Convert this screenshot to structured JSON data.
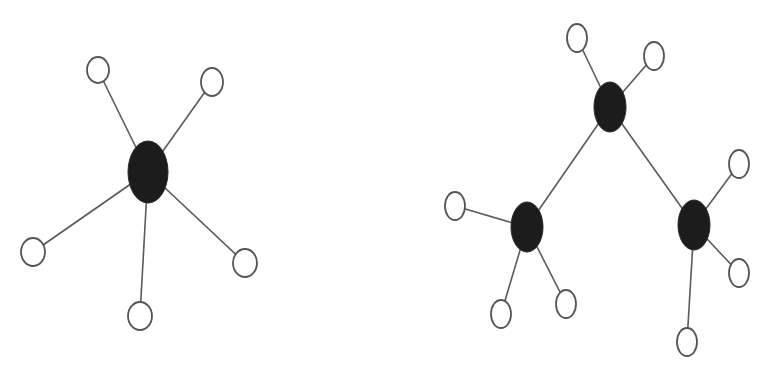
{
  "diagram": {
    "description": "Two network topology graphs: a star topology (left) and a tree/hierarchical topology (right)",
    "colors": {
      "hub": "#1c1c1c",
      "leaf_fill": "#ffffff",
      "leaf_stroke": "#555555",
      "edge": "#5a5a5a",
      "background": "#ffffff"
    },
    "graphs": [
      {
        "name": "star",
        "hubs": [
          {
            "id": "h0",
            "cx": 148,
            "cy": 172,
            "rx": 20,
            "ry": 31
          }
        ],
        "leaves": [
          {
            "id": "l0",
            "cx": 98,
            "cy": 70,
            "rx": 11,
            "ry": 13
          },
          {
            "id": "l1",
            "cx": 212,
            "cy": 82,
            "rx": 11,
            "ry": 14
          },
          {
            "id": "l2",
            "cx": 33,
            "cy": 252,
            "rx": 12,
            "ry": 14
          },
          {
            "id": "l3",
            "cx": 140,
            "cy": 316,
            "rx": 12,
            "ry": 14
          },
          {
            "id": "l4",
            "cx": 245,
            "cy": 263,
            "rx": 12,
            "ry": 14
          }
        ],
        "edges": [
          [
            "h0",
            "l0"
          ],
          [
            "h0",
            "l1"
          ],
          [
            "h0",
            "l2"
          ],
          [
            "h0",
            "l3"
          ],
          [
            "h0",
            "l4"
          ]
        ]
      },
      {
        "name": "tree",
        "hubs": [
          {
            "id": "t0",
            "cx": 610,
            "cy": 107,
            "rx": 16,
            "ry": 25
          },
          {
            "id": "t1",
            "cx": 527,
            "cy": 227,
            "rx": 16,
            "ry": 25
          },
          {
            "id": "t2",
            "cx": 694,
            "cy": 225,
            "rx": 16,
            "ry": 25
          }
        ],
        "leaves": [
          {
            "id": "a0",
            "cx": 577,
            "cy": 38,
            "rx": 10,
            "ry": 14
          },
          {
            "id": "a1",
            "cx": 654,
            "cy": 56,
            "rx": 10,
            "ry": 14
          },
          {
            "id": "b0",
            "cx": 455,
            "cy": 206,
            "rx": 10,
            "ry": 14
          },
          {
            "id": "b1",
            "cx": 501,
            "cy": 314,
            "rx": 10,
            "ry": 14
          },
          {
            "id": "b2",
            "cx": 566,
            "cy": 304,
            "rx": 10,
            "ry": 14
          },
          {
            "id": "c0",
            "cx": 739,
            "cy": 164,
            "rx": 10,
            "ry": 14
          },
          {
            "id": "c1",
            "cx": 739,
            "cy": 273,
            "rx": 10,
            "ry": 14
          },
          {
            "id": "c2",
            "cx": 687,
            "cy": 342,
            "rx": 10,
            "ry": 14
          }
        ],
        "edges": [
          [
            "t0",
            "a0"
          ],
          [
            "t0",
            "a1"
          ],
          [
            "t0",
            "t1"
          ],
          [
            "t0",
            "t2"
          ],
          [
            "t1",
            "b0"
          ],
          [
            "t1",
            "b1"
          ],
          [
            "t1",
            "b2"
          ],
          [
            "t2",
            "c0"
          ],
          [
            "t2",
            "c1"
          ],
          [
            "t2",
            "c2"
          ]
        ]
      }
    ]
  }
}
